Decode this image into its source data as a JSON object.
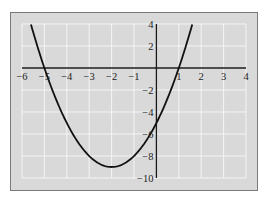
{
  "chart_data": {
    "type": "line",
    "title": "",
    "xlabel": "",
    "ylabel": "",
    "function": "y = x^2 + 4x - 5",
    "xlim": [
      -6,
      4
    ],
    "ylim": [
      -10,
      4
    ],
    "x_domain": [
      -5.6,
      1.6
    ],
    "x_ticks": [
      -6,
      -5,
      -4,
      -3,
      -2,
      -1,
      1,
      2,
      3,
      4
    ],
    "x_tick_labels": [
      "−6",
      "−5",
      "−4",
      "−3",
      "−2",
      "−1",
      "1",
      "2",
      "3",
      "4"
    ],
    "y_ticks": [
      4,
      2,
      -2,
      -4,
      -6,
      -8,
      -10
    ],
    "y_tick_labels": [
      "4",
      "2",
      "−2",
      "−4",
      "−6",
      "−8",
      "−10"
    ],
    "x_grid": [
      -6,
      -5,
      -4,
      -3,
      -2,
      -1,
      0,
      1,
      2,
      3,
      4
    ],
    "y_grid": [
      4,
      2,
      0,
      -2,
      -4,
      -6,
      -8,
      -10
    ],
    "grid": true,
    "legend": "none",
    "key_points": {
      "roots": [
        -5,
        1
      ],
      "vertex": [
        -2,
        -9
      ],
      "y_intercept": -5
    },
    "series": [
      {
        "name": "parabola",
        "x": [
          -5.6,
          -5,
          -4,
          -3,
          -2,
          -1,
          0,
          1,
          1.6
        ],
        "y": [
          3.96,
          0,
          -5,
          -8,
          -9,
          -8,
          -5,
          0,
          3.96
        ]
      }
    ],
    "colors": {
      "plot_background": "#d9d9d9",
      "grid": "#f4f4f4",
      "axis": "#1a1a1a",
      "curve": "#111111",
      "frame": "#7a7a7a"
    }
  }
}
